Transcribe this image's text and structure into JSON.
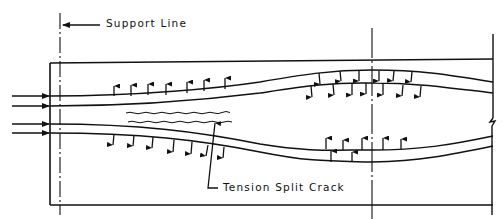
{
  "diagram": {
    "type": "engineering-section",
    "labels": {
      "support_line": "Support Line",
      "crack": "Tension Split Crack"
    },
    "colors": {
      "ink": "#111111",
      "background": "#ffffff"
    },
    "elements": {
      "beam_outline": {
        "x1": 50,
        "y1": 63,
        "x2": 493,
        "y2": 205
      },
      "support_centerline_x": 60,
      "midspan_centerline_x": 372,
      "right_end_x": 493,
      "applied_forces": {
        "count": 4,
        "direction": "right",
        "y": [
          96,
          106,
          124,
          133
        ]
      },
      "upper_tendon_arrows": {
        "direction": "up",
        "count": 7
      },
      "upper_tendon_midspan_arrows": {
        "direction": "down",
        "count": 13
      },
      "lower_tendon_arrows": {
        "direction": "down",
        "count": 7
      },
      "lower_tendon_midspan_arrows": {
        "direction": "up",
        "count": 7
      }
    }
  }
}
